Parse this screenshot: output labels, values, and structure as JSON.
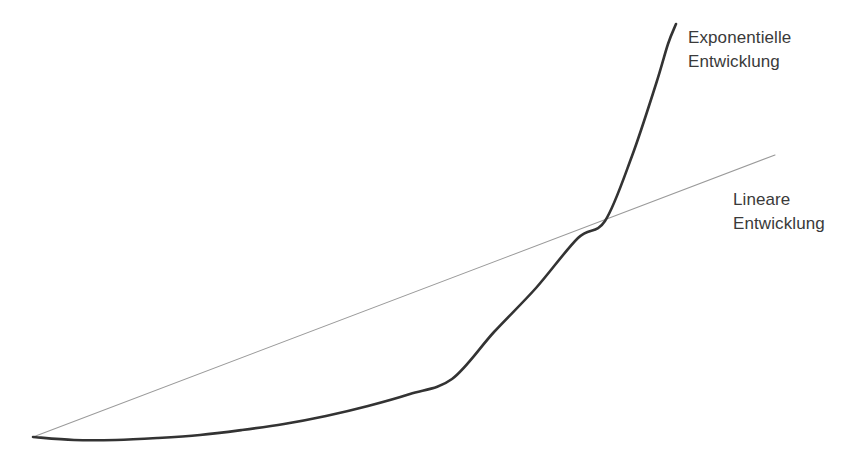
{
  "canvas": {
    "width": 864,
    "height": 471,
    "background": "#ffffff"
  },
  "annotations": {
    "exponential": {
      "line1": "Exponentielle",
      "line2": "Entwicklung",
      "color": "#3a3a3a",
      "x": 688,
      "y": 26
    },
    "linear": {
      "line1": "Lineare",
      "line2": "Entwicklung",
      "color": "#3a3a3a",
      "x": 733,
      "y": 188
    }
  },
  "chart_data": {
    "type": "line",
    "title": "",
    "subtitle": "",
    "xlabel": "",
    "ylabel": "",
    "xlim": [
      0,
      1
    ],
    "ylim": [
      0,
      1
    ],
    "grid": false,
    "axes_visible": false,
    "tick_labels": [],
    "legend": {
      "position": "inline-annotations",
      "entries": [
        "Exponentielle Entwicklung",
        "Lineare Entwicklung"
      ]
    },
    "series": [
      {
        "name": "Exponentielle Entwicklung",
        "label_line1": "Exponentielle",
        "label_line2": "Entwicklung",
        "color": "#333333",
        "stroke_width": 2.6,
        "style": "solid",
        "shape": "exponential",
        "x": [
          0.0,
          0.06,
          0.12,
          0.18,
          0.24,
          0.3,
          0.36,
          0.42,
          0.48,
          0.54,
          0.6,
          0.66,
          0.72,
          0.78,
          0.84,
          0.9,
          0.96,
          1.0
        ],
        "y": [
          0.0,
          -0.004,
          0.004,
          0.021,
          0.046,
          0.08,
          0.123,
          0.177,
          0.243,
          0.322,
          0.416,
          0.5,
          0.59,
          0.69,
          0.79,
          0.89,
          0.965,
          1.0
        ],
        "pixel_points": [
          [
            33,
            437
          ],
          [
            74,
            440
          ],
          [
            116,
            440
          ],
          [
            158,
            438
          ],
          [
            200,
            435
          ],
          [
            242,
            430
          ],
          [
            284,
            424
          ],
          [
            326,
            416
          ],
          [
            368,
            406
          ],
          [
            410,
            394
          ],
          [
            452,
            379
          ],
          [
            494,
            332
          ],
          [
            536,
            288
          ],
          [
            578,
            238
          ],
          [
            605,
            221
          ],
          [
            632,
            156
          ],
          [
            656,
            84
          ],
          [
            668,
            44
          ],
          [
            676,
            24
          ]
        ]
      },
      {
        "name": "Lineare Entwicklung",
        "label_line1": "Lineare",
        "label_line2": "Entwicklung",
        "color": "#9a9a9a",
        "stroke_width": 1.1,
        "style": "solid",
        "shape": "linear",
        "x": [
          0.0,
          1.0
        ],
        "y": [
          0.0,
          1.0
        ],
        "pixel_points": [
          [
            33,
            437
          ],
          [
            775,
            155
          ]
        ]
      }
    ],
    "intersection": {
      "label": "crossing point",
      "pixel": [
        605,
        221
      ]
    }
  }
}
